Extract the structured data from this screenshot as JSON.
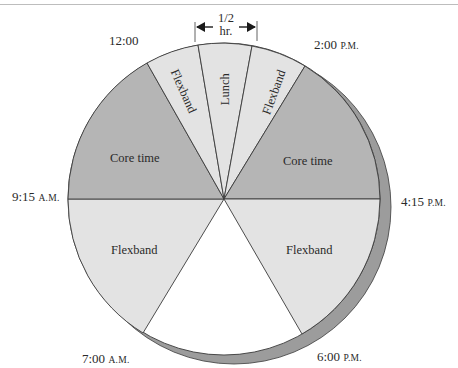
{
  "diagram": {
    "type": "flextime-pie",
    "colors": {
      "core_time": "#b5b5b5",
      "flexband": "#e3e3e3",
      "lunch": "#e3e3e3",
      "off_hours": "#ffffff",
      "shadow": "#9c9c9c",
      "outline": "#3a3a3a"
    },
    "time_labels": {
      "t1200": {
        "time": "12:00",
        "suffix": ""
      },
      "t0200": {
        "time": "2:00",
        "suffix": "P.M."
      },
      "t0415": {
        "time": "4:15",
        "suffix": "P.M."
      },
      "t0600": {
        "time": "6:00",
        "suffix": "P.M."
      },
      "t0700": {
        "time": "7:00",
        "suffix": "A.M."
      },
      "t0915": {
        "time": "9:15",
        "suffix": "A.M."
      }
    },
    "half_hour_marker": {
      "line1": "1/2",
      "line2": "hr."
    },
    "segments": [
      {
        "label": "Flexband",
        "from": "7:00 A.M.",
        "to": "9:15 A.M.",
        "kind": "flexband"
      },
      {
        "label": "Core time",
        "from": "9:15 A.M.",
        "to": "11:30 A.M.",
        "kind": "core_time"
      },
      {
        "label": "Flexband",
        "from": "11:30 A.M.",
        "to": "12:00",
        "kind": "flexband"
      },
      {
        "label": "Lunch",
        "from": "12:00",
        "to": "12:30",
        "kind": "lunch"
      },
      {
        "label": "Flexband",
        "from": "12:30",
        "to": "2:00 P.M.",
        "kind": "flexband"
      },
      {
        "label": "Core time",
        "from": "2:00 P.M.",
        "to": "4:15 P.M.",
        "kind": "core_time"
      },
      {
        "label": "Flexband",
        "from": "4:15 P.M.",
        "to": "6:00 P.M.",
        "kind": "flexband"
      }
    ]
  }
}
